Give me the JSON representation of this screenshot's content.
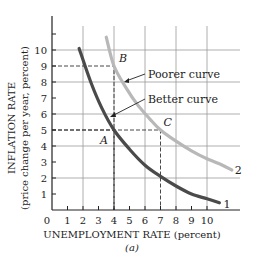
{
  "chart_data": {
    "type": "line",
    "title": "",
    "xlabel": "UNEMPLOYMENT RATE (percent)",
    "xlabel_sub": "(a)",
    "ylabel": "INFLATION RATE",
    "ylabel_sub": "(price change per year, percent)",
    "xlim": [
      0,
      11.5
    ],
    "ylim": [
      0,
      12
    ],
    "x_ticks": [
      0,
      1,
      2,
      3,
      4,
      5,
      6,
      7,
      8,
      9,
      10
    ],
    "x_tick_labels": [
      "0",
      "1",
      "2",
      "3",
      "4",
      "5",
      "6",
      "7",
      "8",
      "9",
      "10"
    ],
    "y_ticks": [
      1,
      2,
      3,
      4,
      5,
      6,
      7,
      8,
      9,
      10,
      11
    ],
    "y_tick_labels": [
      "1",
      "2",
      "3",
      "4",
      "5",
      "6",
      "7",
      "8",
      "9",
      "10",
      ""
    ],
    "grid": {
      "x": [
        2,
        4,
        6,
        8,
        10
      ],
      "y": [
        2,
        4,
        6,
        8,
        10
      ]
    },
    "series": [
      {
        "name": "1",
        "label": "Better curve",
        "color": "#4a4a4a",
        "x": [
          1.75,
          2.5,
          3.2,
          4.0,
          5.0,
          6.0,
          7.0,
          8.0,
          9.0,
          10.0,
          10.8
        ],
        "y": [
          10.1,
          8.0,
          6.4,
          5.0,
          3.8,
          2.8,
          2.1,
          1.5,
          1.0,
          0.7,
          0.45
        ]
      },
      {
        "name": "2",
        "label": "Poorer curve",
        "color": "#b8b8b8",
        "x": [
          3.5,
          4.0,
          4.8,
          5.5,
          6.3,
          7.0,
          8.0,
          9.0,
          10.0,
          11.0,
          11.6
        ],
        "y": [
          10.8,
          9.0,
          7.6,
          6.6,
          5.7,
          5.0,
          4.3,
          3.7,
          3.2,
          2.8,
          2.5
        ]
      }
    ],
    "points": [
      {
        "label": "A",
        "x": 4,
        "y": 5
      },
      {
        "label": "B",
        "x": 4,
        "y": 9
      },
      {
        "label": "C",
        "x": 7,
        "y": 5
      }
    ],
    "annotations": [
      {
        "text": "Poorer curve",
        "points_to_series": "2"
      },
      {
        "text": "Better curve",
        "points_to_series": "1"
      }
    ],
    "end_labels": [
      "1",
      "2"
    ],
    "legend": "none"
  }
}
